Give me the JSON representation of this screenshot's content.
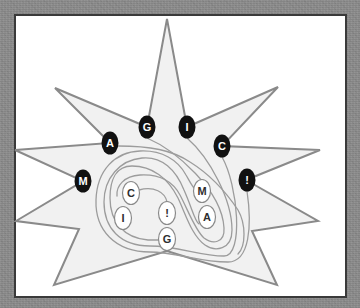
{
  "illustration": {
    "outer_badges": [
      {
        "letter": "M"
      },
      {
        "letter": "A"
      },
      {
        "letter": "G"
      },
      {
        "letter": "I"
      },
      {
        "letter": "C"
      },
      {
        "letter": "!"
      }
    ],
    "inner_badges": [
      {
        "letter": "C"
      },
      {
        "letter": "I"
      },
      {
        "letter": "!"
      },
      {
        "letter": "G"
      },
      {
        "letter": "M"
      },
      {
        "letter": "A"
      }
    ]
  },
  "colors": {
    "background": "#8e8e8e",
    "frame_fill": "#ffffff",
    "frame_border": "#3a3a3a",
    "star_fill": "#f1f1f1",
    "star_stroke": "#8a8a8a",
    "swirl_stroke": "#9c9c9c",
    "outer_badge_fill": "#111111",
    "outer_badge_text": "#ffffff",
    "inner_badge_fill": "#ffffff",
    "inner_badge_stroke": "#8a8a8a",
    "inner_badge_text": "#2e2e2e"
  }
}
